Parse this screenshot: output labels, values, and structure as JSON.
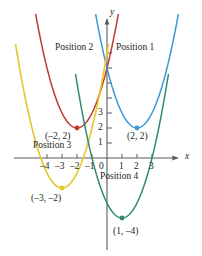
{
  "chart_data": {
    "type": "line",
    "title": "",
    "xlabel": "x",
    "ylabel": "y",
    "xlim": [
      -4.9,
      4.1
    ],
    "ylim": [
      -5.6,
      6.3
    ],
    "grid": false,
    "legend_position": "inline-annotations",
    "xticks": [
      -4,
      -3,
      -2,
      -1,
      0,
      1,
      2,
      3
    ],
    "xtick_labels": [
      "–4",
      "–3",
      "–2",
      "–1",
      "0",
      "1",
      "2",
      "3"
    ],
    "yticks": [
      1,
      2,
      3
    ],
    "ytick_labels": [
      "1",
      "2",
      "3"
    ],
    "series": [
      {
        "name": "Position 1",
        "color": "#3f97d3",
        "equation": "y = (x - 2)^2 + 2",
        "vertex": [
          2,
          2
        ],
        "vertex_label": "(2, 2)",
        "annotation": "Position 1"
      },
      {
        "name": "Position 2",
        "color": "#c0392f",
        "equation": "y = (x + 2)^2 + 2",
        "vertex": [
          -2,
          2
        ],
        "vertex_label": "(–2, 2)",
        "annotation": "Position 2"
      },
      {
        "name": "Position 3",
        "color": "#e8c832",
        "equation": "y = (x + 3)^2 - 2",
        "vertex": [
          -3,
          -2
        ],
        "vertex_label": "(–3, –2)",
        "annotation": "Position 3"
      },
      {
        "name": "Position 4",
        "color": "#2e8b72",
        "equation": "y = (x - 1)^2 - 4",
        "vertex": [
          1,
          -4
        ],
        "vertex_label": "(1, –4)",
        "annotation": "Position 4"
      }
    ]
  },
  "axes": {
    "x_axis_name": "x",
    "y_axis_name": "y",
    "axis_color": "#58595b",
    "origin_label": "0"
  },
  "annotations": {
    "position_1": "Position 1",
    "position_2": "Position 2",
    "position_3": "Position 3",
    "position_4": "Position 4",
    "vertex_1": "(2, 2)",
    "vertex_2": "(–2, 2)",
    "vertex_3": "(–3, –2)",
    "vertex_4": "(1, –4)"
  },
  "xtick_labels": {
    "m4": "–4",
    "m3": "–3",
    "m2": "–2",
    "m1": "–1",
    "zero": "0",
    "p1": "1",
    "p2": "2",
    "p3": "3"
  },
  "ytick_labels": {
    "y1": "1",
    "y2": "2",
    "y3": "3"
  }
}
